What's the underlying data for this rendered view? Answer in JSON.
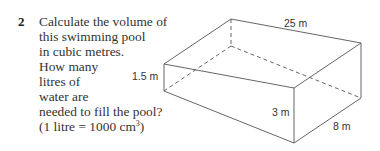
{
  "question": {
    "number": "2",
    "lines": [
      "Calculate the volume of",
      "this swimming pool",
      "in cubic metres.",
      "How many",
      "litres of",
      "water are",
      "needed to fill the pool?",
      "(1 litre = 1000 cm",
      "3",
      ")"
    ]
  },
  "figure": {
    "shape": "swimming-pool-prism",
    "labels": {
      "length": "25 m",
      "shallow_depth": "1.5 m",
      "deep_depth": "3 m",
      "width": "8 m"
    },
    "line_color": "#555555"
  }
}
